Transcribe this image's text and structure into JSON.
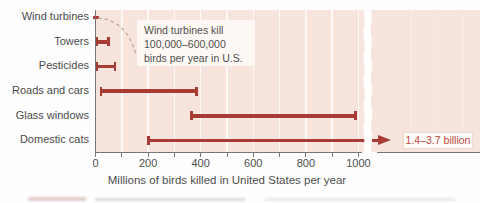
{
  "figure": {
    "kind": "textbook-chart-figure",
    "axis_title": "Millions of birds killed in United States per year",
    "annotation_note": "Wind turbines kill\n100,000–600,000\nbirds per year in U.S.",
    "overflow_label": "1.4–3.7 billion"
  },
  "chart_data": {
    "type": "bar",
    "orientation": "horizontal-range-bars",
    "title": "",
    "xlabel": "Millions of birds killed in United States per year",
    "ylabel": "",
    "xlim": [
      0,
      1000
    ],
    "x_ticks": [
      0,
      200,
      400,
      600,
      800,
      1000
    ],
    "x_minor_tick_interval": 100,
    "grid": "vertical-white-gridlines-every-100",
    "axis_break_after_x": 1000,
    "categories": [
      "Wind turbines",
      "Towers",
      "Pesticides",
      "Roads and cars",
      "Glass windows",
      "Domestic cats"
    ],
    "ranges_millions": [
      [
        0.1,
        0.6
      ],
      [
        5,
        50
      ],
      [
        5,
        75
      ],
      [
        20,
        385
      ],
      [
        365,
        990
      ],
      [
        200,
        null
      ]
    ],
    "domestic_cats_overflow": {
      "off_scale": true,
      "label": "1.4–3.7 billion",
      "actual_range_billions": [
        1.4,
        3.7
      ]
    },
    "annotation": {
      "target_category": "Wind turbines",
      "text": "Wind turbines kill\n100,000–600,000\nbirds per year in U.S.",
      "connector": "dashed-curve"
    },
    "colors": {
      "bar": "#a63c33",
      "overflow_label_red": "#bb4a40",
      "plot_background": "#f7e4dc",
      "gridline": "#ffffff",
      "text_gray": "#4a4a4a"
    }
  }
}
